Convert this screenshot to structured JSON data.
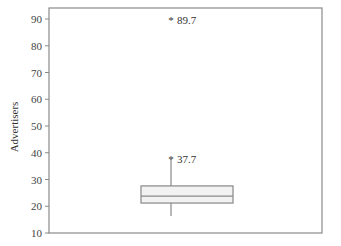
{
  "chart_data": {
    "type": "box",
    "title": "",
    "xlabel": "",
    "ylabel": "Advertisers",
    "ylim": [
      10,
      94
    ],
    "yticks": [
      10,
      20,
      30,
      40,
      50,
      60,
      70,
      80,
      90
    ],
    "grid": false,
    "box": {
      "q1": 21.2,
      "median": 23.8,
      "q3": 27.6,
      "whisker_low": 16.4,
      "whisker_high": 37.7
    },
    "labeled_points": [
      {
        "value": 37.7,
        "label": "37.7",
        "marker": "*"
      },
      {
        "value": 89.7,
        "label": "89.7",
        "marker": "*"
      }
    ],
    "colors": {
      "box_fill": "#f2f2f2",
      "box_stroke": "#888888",
      "axis": "#888888"
    }
  }
}
